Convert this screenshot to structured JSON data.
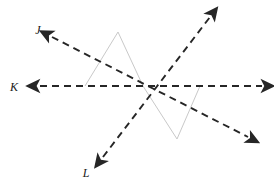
{
  "figure": {
    "background_color": "#ffffff",
    "width": 274,
    "height": 191
  },
  "style": {
    "line_color": "#262626",
    "line_width": 1.9,
    "dash_pattern": "7,5",
    "zigzag_color": "#c9c9c9",
    "zigzag_width": 1.0,
    "label_color": "#1a1a1a",
    "label_font_size": 12
  },
  "intersection_point": {
    "name": "common-intersection",
    "x": 143,
    "y": 86
  },
  "lines": [
    {
      "id": "line-j",
      "label": "J",
      "label_x": 38,
      "label_y": 34,
      "x1": 52,
      "y1": 37,
      "x2": 248,
      "y2": 137,
      "arrow_start": true,
      "arrow_end": true,
      "description": "dashed line from upper-left to lower-right"
    },
    {
      "id": "line-k",
      "label": "K",
      "label_x": 14,
      "label_y": 91,
      "x1": 40,
      "y1": 86,
      "x2": 262,
      "y2": 86,
      "arrow_start": true,
      "arrow_end": true,
      "description": "horizontal dashed line"
    },
    {
      "id": "line-l",
      "label": "L",
      "label_x": 86,
      "label_y": 177,
      "x1": 103,
      "y1": 157,
      "x2": 210,
      "y2": 17,
      "arrow_start": true,
      "arrow_end": true,
      "description": "dashed line from lower-left to upper-right"
    }
  ],
  "zigzag": {
    "id": "gray-zigzag",
    "points": "85,86 118,32 143,86 177,139 200,86",
    "description": "light gray W-shaped polyline passing through the intersection"
  }
}
